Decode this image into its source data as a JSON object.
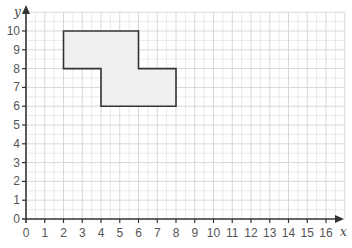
{
  "chart_data": {
    "type": "diagram",
    "title": "",
    "xlabel": "x",
    "ylabel": "y",
    "xlim": [
      0,
      17
    ],
    "ylim": [
      0,
      11
    ],
    "grid": true,
    "x_ticks": [
      0,
      1,
      2,
      3,
      4,
      5,
      6,
      7,
      8,
      9,
      10,
      11,
      12,
      13,
      14,
      15,
      16
    ],
    "y_ticks": [
      0,
      1,
      2,
      3,
      4,
      5,
      6,
      7,
      8,
      9,
      10
    ],
    "x_tick_labels": [
      "0",
      "1",
      "2",
      "3",
      "4",
      "5",
      "6",
      "7",
      "8",
      "9",
      "10",
      "11",
      "12",
      "13",
      "14",
      "15",
      "16"
    ],
    "y_tick_labels": [
      "0",
      "1",
      "2",
      "3",
      "4",
      "5",
      "6",
      "7",
      "8",
      "9",
      "10"
    ],
    "shape": {
      "name": "shaded-polygon",
      "vertices": [
        [
          2,
          10
        ],
        [
          6,
          10
        ],
        [
          6,
          8
        ],
        [
          8,
          8
        ],
        [
          8,
          6
        ],
        [
          4,
          6
        ],
        [
          4,
          8
        ],
        [
          2,
          8
        ]
      ],
      "fill": "#f0f0f0",
      "stroke": "#333333"
    }
  }
}
